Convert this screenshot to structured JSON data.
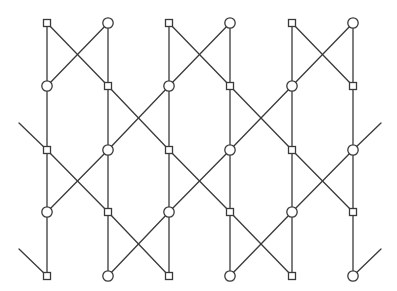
{
  "diagram": {
    "type": "lattice-graph",
    "colors": {
      "line": "#3a3a3a",
      "node_fill": "#ffffff",
      "background": "#ffffff"
    },
    "columns": 6,
    "rows": 5,
    "node_grid": [
      [
        "square",
        "circle",
        "square",
        "circle",
        "square",
        "circle"
      ],
      [
        "circle",
        "square",
        "circle",
        "square",
        "circle",
        "square"
      ],
      [
        "square",
        "circle",
        "square",
        "circle",
        "square",
        "circle"
      ],
      [
        "circle",
        "square",
        "circle",
        "square",
        "circle",
        "square"
      ],
      [
        "square",
        "circle",
        "square",
        "circle",
        "square",
        "circle"
      ]
    ],
    "vertical_edges": "all columns connect consecutive rows",
    "crossings": [
      {
        "row_pair": [
          0,
          1
        ],
        "column_pairs": [
          [
            0,
            1
          ],
          [
            2,
            3
          ],
          [
            4,
            5
          ]
        ]
      },
      {
        "row_pair": [
          1,
          2
        ],
        "column_pairs": [
          [
            1,
            2
          ],
          [
            3,
            4
          ]
        ]
      },
      {
        "row_pair": [
          2,
          3
        ],
        "column_pairs": [
          [
            0,
            1
          ],
          [
            2,
            3
          ],
          [
            4,
            5
          ]
        ]
      },
      {
        "row_pair": [
          3,
          4
        ],
        "column_pairs": [
          [
            1,
            2
          ],
          [
            3,
            4
          ]
        ]
      }
    ],
    "stubs": [
      {
        "side": "left",
        "target": [
          2,
          0
        ]
      },
      {
        "side": "left",
        "target": [
          4,
          0
        ]
      },
      {
        "side": "right",
        "target": [
          2,
          5
        ]
      },
      {
        "side": "right",
        "target": [
          4,
          5
        ]
      }
    ]
  }
}
